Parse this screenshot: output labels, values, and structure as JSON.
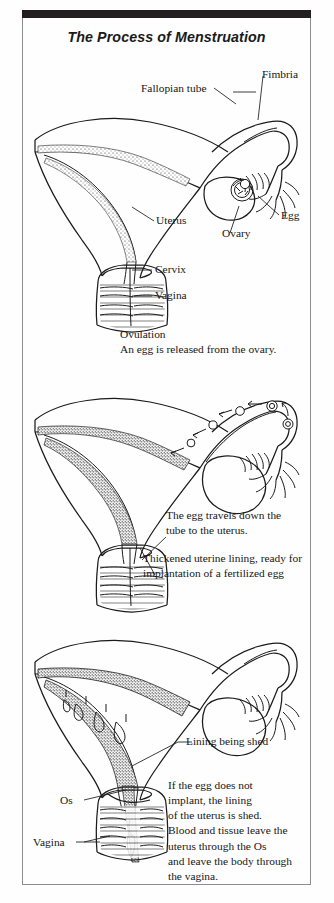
{
  "document": {
    "title": "The Process of Menstruation",
    "type": "medical illustration plate",
    "panel_count": 3
  },
  "panels": [
    {
      "id": "panel-ovulation",
      "stage_number": 1,
      "labels": [
        {
          "name": "fallopian-tube",
          "text": "Fallopian tube"
        },
        {
          "name": "fimbria",
          "text": "Fimbria"
        },
        {
          "name": "uterus",
          "text": "Uterus"
        },
        {
          "name": "ovary",
          "text": "Ovary"
        },
        {
          "name": "egg",
          "text": "Egg"
        },
        {
          "name": "cervix",
          "text": "Cervix"
        },
        {
          "name": "vagina",
          "text": "Vagina"
        }
      ],
      "caption_heading": "Ovulation",
      "caption_body": "An egg is released from the ovary."
    },
    {
      "id": "panel-egg-travel",
      "stage_number": 2,
      "labels": [],
      "caption_body": "The egg travels down the\ntube to the uterus.",
      "caption_secondary": "Thickened uterine lining, ready for\nimplantation of a fertilized egg"
    },
    {
      "id": "panel-shedding",
      "stage_number": 3,
      "labels": [
        {
          "name": "lining-being-shed",
          "text": "Lining being shed"
        },
        {
          "name": "os",
          "text": "Os"
        },
        {
          "name": "vagina",
          "text": "Vagina"
        }
      ],
      "caption_body": "If the egg does not\nimplant, the lining\nof the uterus is shed.\nBlood and tissue leave the\nuterus through the Os\nand leave the body through\nthe vagina."
    }
  ],
  "colors": {
    "ink": "#1b1b1b",
    "paper": "#fefefe",
    "top_bar": "#231f20",
    "frame": "#8d8d8d"
  }
}
